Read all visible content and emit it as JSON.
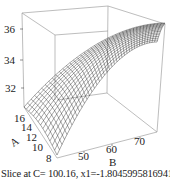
{
  "chart_data": {
    "type": "surface",
    "title": "",
    "caption": "Slice at C= 100.16, x1=-1.80459958169412",
    "axes": {
      "x": {
        "label": "B",
        "ticks": [
          50,
          60,
          70
        ],
        "range": [
          45,
          76
        ]
      },
      "y": {
        "label": "A",
        "ticks": [
          8,
          10,
          12,
          14,
          16
        ],
        "range": [
          7,
          17
        ]
      },
      "z": {
        "label": "",
        "ticks": [
          32,
          34,
          36
        ],
        "range": [
          30.5,
          36.8
        ]
      }
    },
    "surface_description": "Concave-down response surface; response increases with B toward ~36.5 at B≈75, nearly flat in A",
    "grid": false,
    "style": {
      "mesh_color": "#000000",
      "box_color": "#9a9a9a",
      "background": "#ffffff"
    }
  },
  "labels": {
    "z_ticks": [
      "36",
      "34",
      "32"
    ],
    "a_ticks": [
      "16",
      "14",
      "12",
      "10",
      "8"
    ],
    "b_ticks": [
      "50",
      "60",
      "70"
    ],
    "a_title": "A",
    "b_title": "B",
    "caption": "Slice at C= 100.16, x1=-1.80459958169412"
  }
}
